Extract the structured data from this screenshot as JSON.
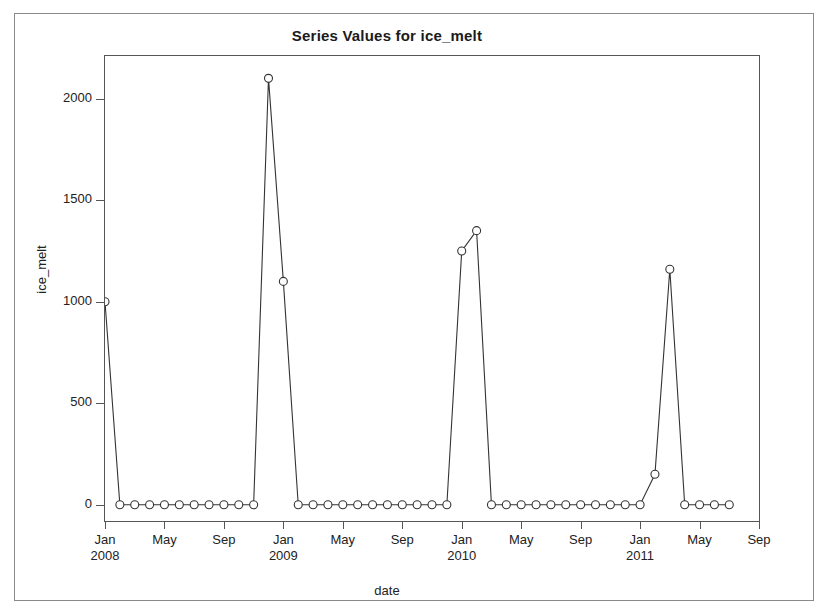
{
  "window": {
    "background_color": "#ffffff",
    "frame_color": "#8a8a8a"
  },
  "chart_data": {
    "type": "line",
    "title": "Series Values for ice_melt",
    "xlabel": "date",
    "ylabel": "ice_melt",
    "grid": false,
    "legend": false,
    "marker": "open-circle",
    "line_color": "#333333",
    "marker_color": "#333333",
    "ylim": [
      -80,
      2210
    ],
    "yticks": [
      0,
      500,
      1000,
      1500,
      2000
    ],
    "ytick_labels": [
      "0",
      "500",
      "1000",
      "1500",
      "2000"
    ],
    "xtick_labels": [
      {
        "month": "Jan",
        "year": "2008"
      },
      {
        "month": "May",
        "year": ""
      },
      {
        "month": "Sep",
        "year": ""
      },
      {
        "month": "Jan",
        "year": "2009"
      },
      {
        "month": "May",
        "year": ""
      },
      {
        "month": "Sep",
        "year": ""
      },
      {
        "month": "Jan",
        "year": "2010"
      },
      {
        "month": "May",
        "year": ""
      },
      {
        "month": "Sep",
        "year": ""
      },
      {
        "month": "Jan",
        "year": "2011"
      },
      {
        "month": "May",
        "year": ""
      },
      {
        "month": "Sep",
        "year": ""
      }
    ],
    "xlim": [
      0,
      44
    ],
    "x": [
      0,
      1,
      2,
      3,
      4,
      5,
      6,
      7,
      8,
      9,
      10,
      11,
      12,
      13,
      14,
      15,
      16,
      17,
      18,
      19,
      20,
      21,
      22,
      23,
      24,
      25,
      26,
      27,
      28,
      29,
      30,
      31,
      32,
      33,
      34,
      35,
      36,
      37,
      38,
      39,
      40,
      41,
      42
    ],
    "x_dates": [
      "Jan 2008",
      "Feb 2008",
      "Mar 2008",
      "Apr 2008",
      "May 2008",
      "Jun 2008",
      "Jul 2008",
      "Aug 2008",
      "Sep 2008",
      "Oct 2008",
      "Nov 2008",
      "Dec 2008",
      "Jan 2009",
      "Feb 2009",
      "Mar 2009",
      "Apr 2009",
      "May 2009",
      "Jun 2009",
      "Jul 2009",
      "Aug 2009",
      "Sep 2009",
      "Oct 2009",
      "Nov 2009",
      "Dec 2009",
      "Jan 2010",
      "Feb 2010",
      "Mar 2010",
      "Apr 2010",
      "May 2010",
      "Jun 2010",
      "Jul 2010",
      "Aug 2010",
      "Sep 2010",
      "Oct 2010",
      "Nov 2010",
      "Dec 2010",
      "Jan 2011",
      "Feb 2011",
      "Mar 2011",
      "Apr 2011",
      "May 2011",
      "Jun 2011",
      "Jul 2011"
    ],
    "values": [
      1000,
      0,
      0,
      0,
      0,
      0,
      0,
      0,
      0,
      0,
      0,
      2100,
      1100,
      0,
      0,
      0,
      0,
      0,
      0,
      0,
      0,
      0,
      0,
      0,
      1250,
      1350,
      0,
      0,
      0,
      0,
      0,
      0,
      0,
      0,
      0,
      0,
      0,
      150,
      1160,
      0,
      0,
      0,
      0
    ]
  }
}
